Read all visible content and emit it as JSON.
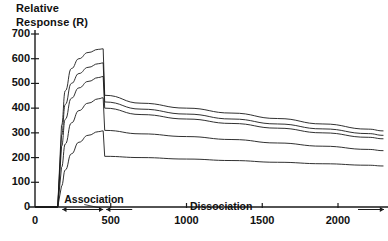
{
  "chart_data": {
    "type": "line",
    "title": "Relative\nResponse (R)",
    "xlabel": "",
    "ylabel": "Relative Response (R)",
    "xlim": [
      0,
      2300
    ],
    "ylim": [
      0,
      700
    ],
    "grid": false,
    "legend_position": "none",
    "y_ticks": [
      700,
      600,
      500,
      400,
      300,
      200,
      100,
      0
    ],
    "x_ticks": [
      0,
      500,
      1000,
      1500,
      2000
    ],
    "annotations": [
      {
        "text": "Association",
        "x_start": 180,
        "x_end": 450
      },
      {
        "text": "Dissociation",
        "x_start": 470,
        "x_end": 2300
      }
    ],
    "series": [
      {
        "name": "curve-1",
        "x": [
          150,
          175,
          200,
          240,
          290,
          350,
          420,
          450,
          460,
          700,
          1000,
          1300,
          1600,
          1900,
          2200,
          2300
        ],
        "y": [
          0,
          330,
          470,
          560,
          600,
          625,
          638,
          640,
          452,
          420,
          400,
          380,
          358,
          336,
          315,
          308
        ]
      },
      {
        "name": "curve-2",
        "x": [
          150,
          175,
          200,
          240,
          290,
          350,
          420,
          450,
          460,
          700,
          1000,
          1300,
          1600,
          1900,
          2200,
          2300
        ],
        "y": [
          0,
          290,
          415,
          500,
          540,
          565,
          580,
          583,
          425,
          396,
          376,
          356,
          336,
          316,
          297,
          290
        ]
      },
      {
        "name": "curve-3",
        "x": [
          150,
          175,
          200,
          240,
          290,
          350,
          420,
          450,
          460,
          700,
          1000,
          1300,
          1600,
          1900,
          2200,
          2300
        ],
        "y": [
          0,
          245,
          355,
          440,
          482,
          508,
          524,
          528,
          400,
          374,
          356,
          338,
          319,
          300,
          282,
          276
        ]
      },
      {
        "name": "curve-4",
        "x": [
          150,
          175,
          200,
          240,
          290,
          350,
          420,
          450,
          460,
          700,
          1000,
          1300,
          1600,
          1900,
          2200,
          2300
        ],
        "y": [
          0,
          160,
          255,
          340,
          390,
          420,
          438,
          442,
          310,
          296,
          285,
          273,
          259,
          246,
          233,
          228
        ]
      },
      {
        "name": "curve-5",
        "x": [
          150,
          175,
          200,
          240,
          290,
          350,
          420,
          450,
          460,
          700,
          1000,
          1300,
          1600,
          1900,
          2200,
          2300
        ],
        "y": [
          0,
          85,
          150,
          215,
          262,
          290,
          305,
          308,
          205,
          200,
          194,
          188,
          181,
          175,
          169,
          166
        ]
      }
    ]
  }
}
